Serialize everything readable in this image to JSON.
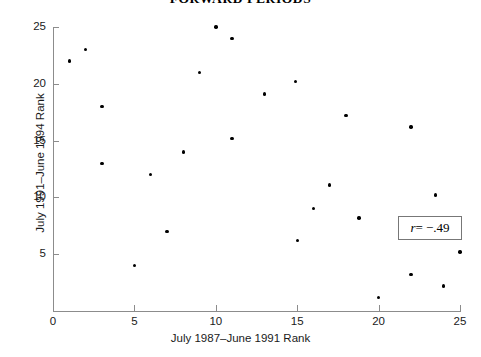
{
  "chart_data": {
    "type": "scatter",
    "title": "FORWARD PERIODS",
    "xlabel": "July 1987–June 1991 Rank",
    "ylabel": "July 1991–June 1994 Rank",
    "xlim": [
      0,
      25
    ],
    "ylim": [
      0,
      25
    ],
    "grid": false,
    "legend": null,
    "xticks": [
      "0",
      "5",
      "10",
      "15",
      "20",
      "25"
    ],
    "xtick_values": [
      0,
      5,
      10,
      15,
      20,
      25
    ],
    "yticks": [
      "5",
      "10",
      "15",
      "20",
      "25"
    ],
    "ytick_values": [
      5,
      10,
      15,
      20,
      25
    ],
    "annotation": {
      "symbol": "r",
      "text": " = −.49",
      "full": "r = −.49",
      "value": -0.49
    },
    "marker": {
      "shape": "circle",
      "color": "#000000",
      "size_px": 3.4
    },
    "points": [
      {
        "x": 1,
        "y": 22.0
      },
      {
        "x": 2,
        "y": 23.0
      },
      {
        "x": 3,
        "y": 18.0
      },
      {
        "x": 3,
        "y": 13.0
      },
      {
        "x": 5,
        "y": 4.0
      },
      {
        "x": 6,
        "y": 12.0
      },
      {
        "x": 7,
        "y": 7.0
      },
      {
        "x": 8,
        "y": 14.0
      },
      {
        "x": 9,
        "y": 21.0
      },
      {
        "x": 10,
        "y": 25.0
      },
      {
        "x": 11,
        "y": 24.0
      },
      {
        "x": 11,
        "y": 15.2
      },
      {
        "x": 13,
        "y": 19.1
      },
      {
        "x": 14.9,
        "y": 20.2
      },
      {
        "x": 15,
        "y": 6.2
      },
      {
        "x": 16,
        "y": 9.0
      },
      {
        "x": 17,
        "y": 11.1
      },
      {
        "x": 18,
        "y": 17.2
      },
      {
        "x": 18.8,
        "y": 8.2
      },
      {
        "x": 20,
        "y": 1.2
      },
      {
        "x": 22,
        "y": 16.2
      },
      {
        "x": 22,
        "y": 3.2
      },
      {
        "x": 23.5,
        "y": 10.2
      },
      {
        "x": 24,
        "y": 2.2
      },
      {
        "x": 25,
        "y": 5.2
      }
    ]
  }
}
